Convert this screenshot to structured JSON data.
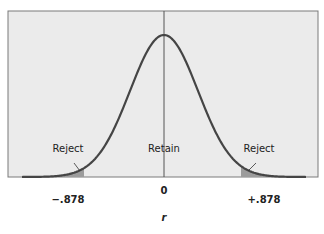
{
  "chart_data": {
    "type": "area",
    "title": "",
    "xlabel": "r",
    "ylabel": "",
    "distribution": "normal (bell curve) sampling distribution of r",
    "critical_values": [
      -0.878,
      0.878
    ],
    "tick_labels": [
      "-.878",
      "0",
      "+.878"
    ],
    "regions": [
      {
        "name": "Reject",
        "range": [
          "-inf",
          -0.878
        ],
        "shaded": true
      },
      {
        "name": "Retain",
        "range": [
          -0.878,
          0.878
        ],
        "shaded": false
      },
      {
        "name": "Reject",
        "range": [
          0.878,
          "inf"
        ],
        "shaded": true
      }
    ],
    "annotations": [
      "Reject",
      "Retain",
      "Reject"
    ],
    "grid": false,
    "legend": "none"
  },
  "labels": {
    "reject_left": "Reject",
    "retain": "Retain",
    "reject_right": "Reject",
    "tick_left": "−.878",
    "tick_center": "0",
    "tick_right": "+.878",
    "axis_title": "r"
  },
  "colors": {
    "panel": "#ebebeb",
    "curve": "#454545",
    "shade": "#9c9c9c",
    "frame": "#7a7a7a"
  }
}
